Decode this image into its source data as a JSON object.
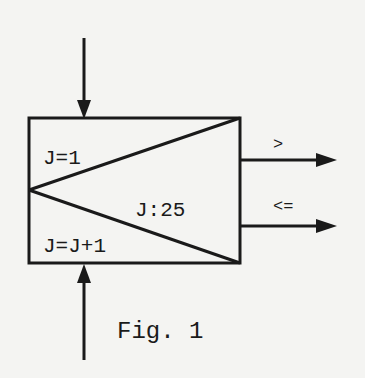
{
  "figure": {
    "caption": "Fig. 1",
    "loop_init": "J=1",
    "loop_test": "J:25",
    "loop_increment": "J=J+1",
    "exit_greater": ">",
    "exit_less_equal": "<=",
    "ink_color": "#1a1a1a",
    "paper_color": "#f4f4f2"
  }
}
